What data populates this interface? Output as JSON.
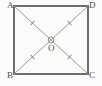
{
  "figure": {
    "kind": "geometry-diagram",
    "background_color": "#fbfbfa",
    "square": {
      "name": "square-ABCD",
      "stroke_color": "#6e6e6e",
      "stroke_width": 1.4,
      "fill": "none",
      "x": 14,
      "y": 6,
      "width": 74,
      "height": 68
    },
    "diagonals": {
      "stroke_color": "#9a9a9a",
      "stroke_width": 1.0,
      "segments": [
        {
          "name": "diagonal-A-C",
          "from": "A",
          "to": "C",
          "x1": 14,
          "y1": 6,
          "x2": 88,
          "y2": 74
        },
        {
          "name": "diagonal-B-D",
          "from": "B",
          "to": "D",
          "x1": 14,
          "y1": 74,
          "x2": 88,
          "y2": 6
        }
      ]
    },
    "center_point": {
      "name": "point-O",
      "x": 51,
      "y": 40,
      "marker": "small-circle",
      "radius": 3.0,
      "stroke_color": "#8f8f8f"
    },
    "tick_marks": {
      "note": "single tick on each of the four half-diagonals indicating equal lengths",
      "stroke_color": "#8f8f8f",
      "count": 4,
      "marks": [
        {
          "name": "tick-AO",
          "segment": "A-O",
          "cx": 32.5,
          "cy": 23.0,
          "angle_deg": 42.6
        },
        {
          "name": "tick-OC",
          "segment": "O-C",
          "cx": 69.5,
          "cy": 57.0,
          "angle_deg": 42.6
        },
        {
          "name": "tick-BO",
          "segment": "B-O",
          "cx": 32.5,
          "cy": 57.0,
          "angle_deg": -42.6
        },
        {
          "name": "tick-OD",
          "segment": "O-D",
          "cx": 69.5,
          "cy": 23.0,
          "angle_deg": -42.6
        }
      ]
    },
    "labels": {
      "A": "A",
      "B": "B",
      "C": "C",
      "D": "D",
      "O": "O"
    }
  }
}
